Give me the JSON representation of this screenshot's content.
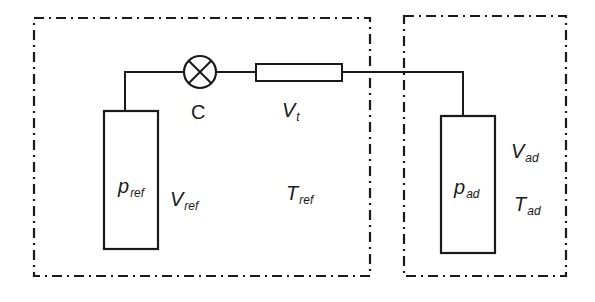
{
  "diagram": {
    "type": "volumetric-adsorption-setup",
    "colors": {
      "line": "#1a1a1a",
      "background": "#ffffff"
    },
    "regions": [
      {
        "id": "reference-region",
        "border": "dash-dot"
      },
      {
        "id": "adsorption-region",
        "border": "dash-dot"
      }
    ],
    "components": {
      "valve": {
        "label": "C",
        "symbol": "circle-with-x"
      },
      "tube": {
        "label_main": "V",
        "label_sub": "t"
      },
      "reference_cell": {
        "pressure_main": "p",
        "pressure_sub": "ref",
        "volume_main": "V",
        "volume_sub": "ref",
        "temperature_main": "T",
        "temperature_sub": "ref"
      },
      "adsorption_cell": {
        "pressure_main": "p",
        "pressure_sub": "ad",
        "volume_main": "V",
        "volume_sub": "ad",
        "temperature_main": "T",
        "temperature_sub": "ad"
      }
    }
  }
}
